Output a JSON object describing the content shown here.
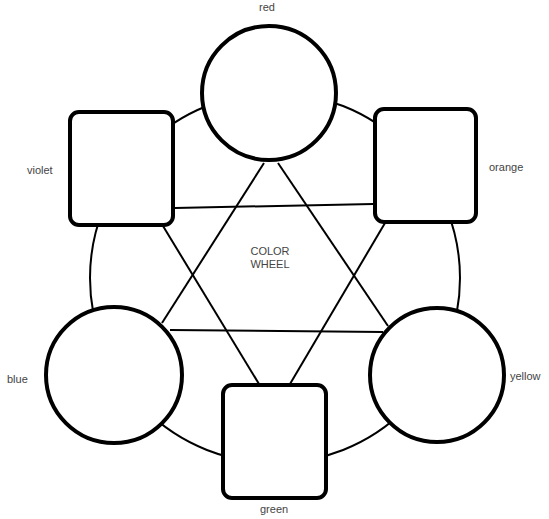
{
  "title": "COLOR WHEEL",
  "center": {
    "line1": "COLOR",
    "line2": "WHEEL"
  },
  "nodes": [
    {
      "id": "red",
      "label": "red",
      "shape": "circle"
    },
    {
      "id": "orange",
      "label": "orange",
      "shape": "square"
    },
    {
      "id": "yellow",
      "label": "yellow",
      "shape": "circle"
    },
    {
      "id": "green",
      "label": "green",
      "shape": "square"
    },
    {
      "id": "blue",
      "label": "blue",
      "shape": "circle"
    },
    {
      "id": "violet",
      "label": "violet",
      "shape": "square"
    }
  ],
  "triangles": [
    {
      "name": "primary",
      "nodes": [
        "red",
        "yellow",
        "blue"
      ]
    },
    {
      "name": "secondary",
      "nodes": [
        "orange",
        "green",
        "violet"
      ]
    }
  ],
  "colors": {
    "stroke": "#000000",
    "background": "#ffffff",
    "text": "#444444"
  }
}
